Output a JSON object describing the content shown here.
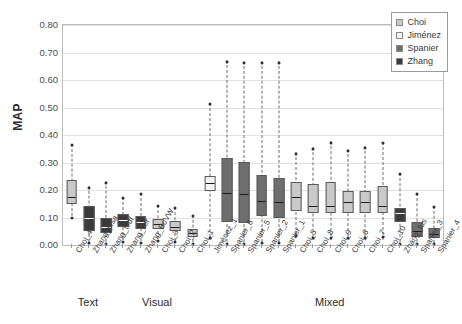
{
  "chart_data": {
    "type": "box",
    "title": "",
    "xlabel": "",
    "ylabel": "MAP",
    "ylim": [
      0.0,
      0.8
    ],
    "ytick_labels": [
      "0.80",
      "0.70",
      "0.60",
      "0.50",
      "0.40",
      "0.30",
      "0.20",
      "0.10",
      "0.00"
    ],
    "ytick_values": [
      0.8,
      0.7,
      0.6,
      0.5,
      0.4,
      0.3,
      0.2,
      0.1,
      0.0
    ],
    "grid": true,
    "legend_position": "top-right",
    "legend": [
      {
        "label": "Choi",
        "color": "#c9c9c9"
      },
      {
        "label": "Jiménez",
        "color": "#f2f2f2"
      },
      {
        "label": "Spanier",
        "color": "#6e6e6e"
      },
      {
        "label": "Zhang",
        "color": "#3a3a3a"
      }
    ],
    "group_labels": [
      "Text",
      "Visual",
      "Mixed"
    ],
    "groups": [
      {
        "name": "Text",
        "start_index": 0,
        "end_index": 2
      },
      {
        "name": "Visual",
        "start_index": 3,
        "end_index": 7
      },
      {
        "name": "Mixed",
        "start_index": 8,
        "end_index": 22
      }
    ],
    "categories": [
      "Choi_4",
      "Zhang_plsa",
      "Zhang_tfidf",
      "Zhang_iter",
      "Zhang_BoVW",
      "Choi_3",
      "Choi_2",
      "Choi_1",
      "Jiménez_1",
      "Spanier_6",
      "Spanier_5",
      "Spanier_2",
      "Spanier_1",
      "Choi_5",
      "Choi_8",
      "Choi_9",
      "Choi_6",
      "Choi_7",
      "Choi_10",
      "Zhang_fus",
      "Spanier_3",
      "Spanier_4"
    ],
    "boxes": [
      {
        "category": "Choi_4",
        "series": "Choi",
        "min": 0.105,
        "q1": 0.15,
        "median": 0.175,
        "q3": 0.235,
        "max": 0.368
      },
      {
        "category": "Zhang_plsa",
        "series": "Zhang",
        "min": 0.012,
        "q1": 0.05,
        "median": 0.098,
        "q3": 0.143,
        "max": 0.213
      },
      {
        "category": "Zhang_tfidf",
        "series": "Zhang",
        "min": 0.01,
        "q1": 0.042,
        "median": 0.066,
        "q3": 0.1,
        "max": 0.232
      },
      {
        "category": "Zhang_iter",
        "series": "Zhang",
        "min": 0.018,
        "q1": 0.065,
        "median": 0.092,
        "q3": 0.112,
        "max": 0.176
      },
      {
        "category": "Zhang_BoVW",
        "series": "Zhang",
        "min": 0.013,
        "q1": 0.058,
        "median": 0.082,
        "q3": 0.106,
        "max": 0.19
      },
      {
        "category": "Choi_3",
        "series": "Choi",
        "min": 0.02,
        "q1": 0.057,
        "median": 0.075,
        "q3": 0.095,
        "max": 0.147
      },
      {
        "category": "Choi_2",
        "series": "Choi",
        "min": 0.015,
        "q1": 0.05,
        "median": 0.067,
        "q3": 0.088,
        "max": 0.14
      },
      {
        "category": "Choi_1",
        "series": "Choi",
        "min": 0.01,
        "q1": 0.03,
        "median": 0.044,
        "q3": 0.058,
        "max": 0.11
      },
      {
        "category": "Jiménez_1",
        "series": "Jiménez",
        "min": 0.03,
        "q1": 0.195,
        "median": 0.226,
        "q3": 0.25,
        "max": 0.518
      },
      {
        "category": "Spanier_6",
        "series": "Spanier",
        "min": 0.01,
        "q1": 0.083,
        "median": 0.19,
        "q3": 0.315,
        "max": 0.672
      },
      {
        "category": "Spanier_5",
        "series": "Spanier",
        "min": 0.01,
        "q1": 0.08,
        "median": 0.185,
        "q3": 0.303,
        "max": 0.668
      },
      {
        "category": "Spanier_2",
        "series": "Spanier",
        "min": 0.012,
        "q1": 0.105,
        "median": 0.16,
        "q3": 0.253,
        "max": 0.668
      },
      {
        "category": "Spanier_1",
        "series": "Spanier",
        "min": 0.012,
        "q1": 0.1,
        "median": 0.155,
        "q3": 0.245,
        "max": 0.668
      },
      {
        "category": "Choi_5",
        "series": "Choi",
        "min": 0.038,
        "q1": 0.125,
        "median": 0.175,
        "q3": 0.228,
        "max": 0.338
      },
      {
        "category": "Choi_8",
        "series": "Choi",
        "min": 0.03,
        "q1": 0.115,
        "median": 0.14,
        "q3": 0.222,
        "max": 0.355
      },
      {
        "category": "Choi_9",
        "series": "Choi",
        "min": 0.032,
        "q1": 0.118,
        "median": 0.143,
        "q3": 0.228,
        "max": 0.378
      },
      {
        "category": "Choi_6",
        "series": "Choi",
        "min": 0.032,
        "q1": 0.118,
        "median": 0.158,
        "q3": 0.195,
        "max": 0.348
      },
      {
        "category": "Choi_7",
        "series": "Choi",
        "min": 0.03,
        "q1": 0.115,
        "median": 0.155,
        "q3": 0.198,
        "max": 0.36
      },
      {
        "category": "Choi_10",
        "series": "Choi",
        "min": 0.035,
        "q1": 0.118,
        "median": 0.14,
        "q3": 0.213,
        "max": 0.375
      },
      {
        "category": "Zhang_fus",
        "series": "Zhang",
        "min": 0.01,
        "q1": 0.083,
        "median": 0.115,
        "q3": 0.135,
        "max": 0.262
      },
      {
        "category": "Spanier_3",
        "series": "Spanier",
        "min": 0.01,
        "q1": 0.03,
        "median": 0.052,
        "q3": 0.085,
        "max": 0.19
      },
      {
        "category": "Spanier_4",
        "series": "Spanier",
        "min": 0.008,
        "q1": 0.025,
        "median": 0.04,
        "q3": 0.063,
        "max": 0.142
      }
    ]
  }
}
